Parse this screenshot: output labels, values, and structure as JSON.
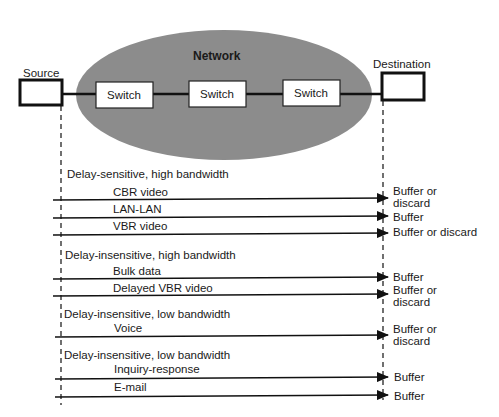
{
  "network": {
    "label": "Network",
    "color": "#8c8c8c"
  },
  "endpoints": {
    "source": "Source",
    "destination": "Destination"
  },
  "switches": [
    "Switch",
    "Switch",
    "Switch"
  ],
  "groups": [
    {
      "heading": "Delay-sensitive,  high bandwidth",
      "flows": [
        {
          "name": "CBR video",
          "action": "Buffer or\ndiscard"
        },
        {
          "name": "LAN-LAN",
          "action": "Buffer"
        },
        {
          "name": "VBR video",
          "action": "Buffer or discard"
        }
      ]
    },
    {
      "heading": "Delay-insensitive, high bandwidth",
      "flows": [
        {
          "name": "Bulk data",
          "action": "Buffer"
        },
        {
          "name": "Delayed VBR video",
          "action": "Buffer or\ndiscard"
        }
      ]
    },
    {
      "heading": "Delay-insensitive, low bandwidth",
      "flows": [
        {
          "name": "Voice",
          "action": "Buffer or\ndiscard"
        }
      ]
    },
    {
      "heading": "Delay-insensitive, low bandwidth",
      "flows": [
        {
          "name": "Inquiry-response",
          "action": "Buffer"
        },
        {
          "name": "E-mail",
          "action": "Buffer"
        }
      ]
    }
  ]
}
